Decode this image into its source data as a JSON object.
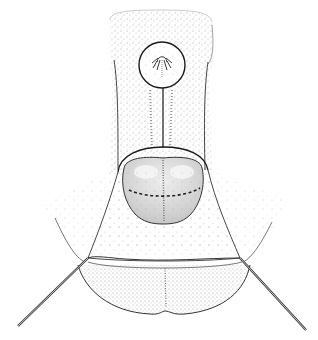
{
  "figure": {
    "kind": "anatomical-stipple-illustration",
    "style": "black ink stipple on white",
    "colors": {
      "background": "#ffffff",
      "ink": "#222222",
      "stipple": "#555555",
      "organ_fill": "#d9d9d9",
      "organ_highlight": "#f2f2f2",
      "retractor": "#444444"
    },
    "elements": {
      "inset_circle": "magnified detail inset",
      "connector_line": "line linking inset to structure",
      "central_structure": "rounded bilobed structure with dashed incision line",
      "incision_line": "dashed line",
      "retractors": [
        "left retractor",
        "right retractor"
      ],
      "lower_lobes": "lower tissue lobes"
    }
  }
}
